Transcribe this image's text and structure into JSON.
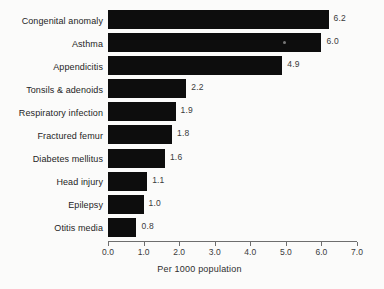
{
  "chart_data": {
    "type": "bar",
    "orientation": "horizontal",
    "title": "",
    "xlabel": "Per 1000 population",
    "ylabel": "",
    "xlim": [
      0.0,
      7.0
    ],
    "xticks": [
      "0.0",
      "1.0",
      "2.0",
      "3.0",
      "4.0",
      "5.0",
      "6.0",
      "7.0"
    ],
    "grid": false,
    "legend": null,
    "bar_color": "#0d0d0d",
    "background_color": "#fbfbfa",
    "categories": [
      "Congenital anomaly",
      "Asthma",
      "Appendicitis",
      "Tonsils & adenoids",
      "Respiratory infection",
      "Fractured femur",
      "Diabetes mellitus",
      "Head injury",
      "Epilepsy",
      "Otitis media"
    ],
    "values": [
      6.2,
      6.0,
      4.9,
      2.2,
      1.9,
      1.8,
      1.6,
      1.1,
      1.0,
      0.8
    ],
    "value_labels": [
      "6.2",
      "6.0",
      "4.9",
      "2.2",
      "1.9",
      "1.8",
      "1.6",
      "1.1",
      "1.0",
      "0.8"
    ]
  }
}
